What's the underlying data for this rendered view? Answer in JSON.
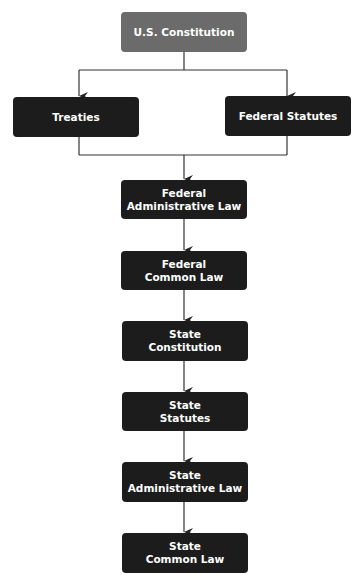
{
  "diagram": {
    "type": "flowchart",
    "direction": "top-to-bottom",
    "colors": {
      "root_fill": "#6b6b6b",
      "node_fill": "#1c1c1c",
      "text": "#ffffff",
      "connector": "#333333",
      "background": "#ffffff"
    },
    "nodes": {
      "us_constitution": {
        "line1": "U.S. Constitution",
        "line2": ""
      },
      "treaties": {
        "line1": "Treaties",
        "line2": ""
      },
      "federal_statutes": {
        "line1": "Federal Statutes",
        "line2": ""
      },
      "federal_administrative_law": {
        "line1": "Federal",
        "line2": "Administrative Law"
      },
      "federal_common_law": {
        "line1": "Federal",
        "line2": "Common Law"
      },
      "state_constitution": {
        "line1": "State",
        "line2": "Constitution"
      },
      "state_statutes": {
        "line1": "State",
        "line2": "Statutes"
      },
      "state_administrative_law": {
        "line1": "State",
        "line2": "Administrative Law"
      },
      "state_common_law": {
        "line1": "State",
        "line2": "Common Law"
      }
    },
    "edges": [
      {
        "from": "U.S. Constitution",
        "to": "Treaties"
      },
      {
        "from": "U.S. Constitution",
        "to": "Federal Statutes"
      },
      {
        "from": "Treaties",
        "to": "Federal Administrative Law"
      },
      {
        "from": "Federal Statutes",
        "to": "Federal Administrative Law"
      },
      {
        "from": "Federal Administrative Law",
        "to": "Federal Common Law"
      },
      {
        "from": "Federal Common Law",
        "to": "State Constitution"
      },
      {
        "from": "State Constitution",
        "to": "State Statutes"
      },
      {
        "from": "State Statutes",
        "to": "State Administrative Law"
      },
      {
        "from": "State Administrative Law",
        "to": "State Common Law"
      }
    ]
  }
}
